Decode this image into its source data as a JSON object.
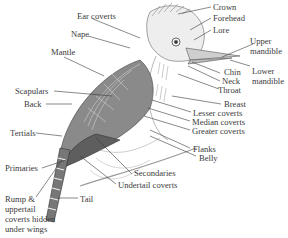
{
  "diagram": {
    "labels": {
      "crown": "Crown",
      "forehead": "Forehead",
      "lore": "Lore",
      "upper_mandible": "Upper mandible",
      "lower_mandible": "Lower mandible",
      "chin": "Chin",
      "neck": "Neck",
      "throat": "Throat",
      "breast": "Breast",
      "lesser_coverts": "Lesser coverts",
      "median_coverts": "Median coverts",
      "greater_coverts": "Greater coverts",
      "flanks": "Flanks",
      "belly": "Belly",
      "ear_coverts": "Ear coverts",
      "nape": "Nape",
      "mantle": "Mantle",
      "scapulars": "Scapulars",
      "back": "Back",
      "tertials": "Tertials",
      "primaries": "Primaries",
      "secondaries": "Secondaries",
      "undertail_coverts": "Undertail coverts",
      "tail": "Tail",
      "rump_note": "Rump & uppertail coverts hidden under wings"
    },
    "colors": {
      "line": "#3a3a3a",
      "sketch": "#555555",
      "background": "#ffffff"
    }
  }
}
